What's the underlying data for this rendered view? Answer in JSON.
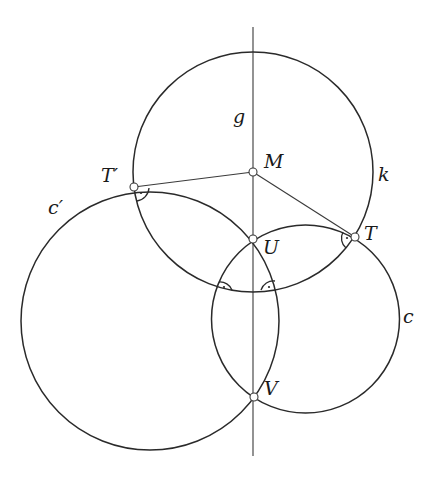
{
  "figure": {
    "type": "geometric-construction",
    "line_g": {
      "label": "g",
      "x": 253,
      "y1": 27,
      "y2": 456
    },
    "circles": [
      {
        "id": "k",
        "label": "k",
        "cx": 253,
        "cy": 172,
        "r": 120
      },
      {
        "id": "c",
        "label": "c",
        "cx": 305.5,
        "cy": 319,
        "r": 94
      },
      {
        "id": "c_prime",
        "label": "c′",
        "cx": 150,
        "cy": 321,
        "r": 129
      }
    ],
    "points": [
      {
        "id": "M",
        "label": "M",
        "x": 253,
        "y": 172
      },
      {
        "id": "T",
        "label": "T",
        "x": 355,
        "y": 237
      },
      {
        "id": "T_prime",
        "label": "T′",
        "x": 134,
        "y": 187
      },
      {
        "id": "U",
        "label": "U",
        "x": 253,
        "y": 239
      },
      {
        "id": "V",
        "label": "V",
        "x": 254,
        "y": 397
      }
    ],
    "segments": [
      {
        "from": "M",
        "to": "T"
      },
      {
        "from": "M",
        "to": "T_prime"
      }
    ],
    "right_angle_marks": [
      "T_prime",
      "T",
      "k∩c′ (lower-left)",
      "k∩c (lower-right)"
    ],
    "labels": {
      "g": "g",
      "M": "M",
      "k": "k",
      "T_prime": "T′",
      "T": "T",
      "c_prime": "c′",
      "U": "U",
      "c": "c",
      "V": "V"
    }
  }
}
